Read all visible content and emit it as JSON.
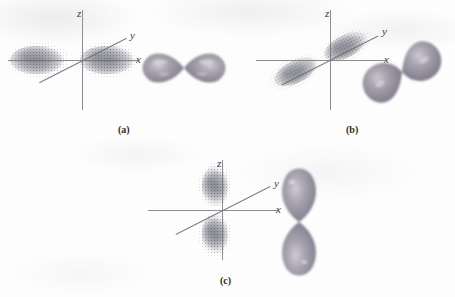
{
  "figure": {
    "background_color": "#fdfdfd",
    "axis_color": "#8d8d93",
    "label_color": "#3b3b40",
    "lobe_color_dark": "#8b8794",
    "lobe_color_mid": "#a9a5b0",
    "lobe_color_light": "#d8d5dc",
    "cloud_dot_color": "#5a5a66"
  },
  "panels": [
    {
      "id": "a",
      "caption": "(a)",
      "orbital": "p-x",
      "axis_labels": {
        "x": "x",
        "y": "y",
        "z": "z"
      },
      "cloud_orientation": "horizontal",
      "lobe_orientation": "horizontal",
      "lobe_axis_degrees": 0
    },
    {
      "id": "b",
      "caption": "(b)",
      "orbital": "p-y",
      "axis_labels": {
        "x": "x",
        "y": "y",
        "z": "z"
      },
      "cloud_orientation": "diagonal",
      "lobe_orientation": "diagonal",
      "lobe_axis_degrees": -35
    },
    {
      "id": "c",
      "caption": "(c)",
      "orbital": "p-z",
      "axis_labels": {
        "x": "x",
        "y": "y",
        "z": "z"
      },
      "cloud_orientation": "vertical",
      "lobe_orientation": "vertical",
      "lobe_axis_degrees": 90
    }
  ]
}
